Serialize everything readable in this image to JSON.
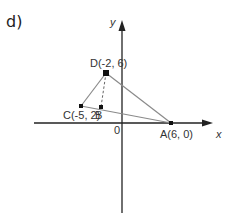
{
  "part_label": "d)",
  "axes": {
    "x_label": "x",
    "y_label": "y",
    "origin_label": "0"
  },
  "points": {
    "D": {
      "label": "D(-2, 6)",
      "x": -2,
      "y": 6
    },
    "C": {
      "label": "C(-5, 2)",
      "x": -5,
      "y": 2
    },
    "B": {
      "label": "B"
    },
    "A": {
      "label": "A(6, 0)",
      "x": 6,
      "y": 0
    }
  },
  "segments": [
    {
      "from": "D",
      "to": "C",
      "style": "solid"
    },
    {
      "from": "C",
      "to": "A",
      "style": "solid"
    },
    {
      "from": "D",
      "to": "A",
      "style": "solid"
    },
    {
      "from": "D",
      "to": "B",
      "style": "dashed"
    }
  ],
  "colors": {
    "axis": "#222222",
    "segment": "#8a8a8a",
    "point": "#111111"
  }
}
